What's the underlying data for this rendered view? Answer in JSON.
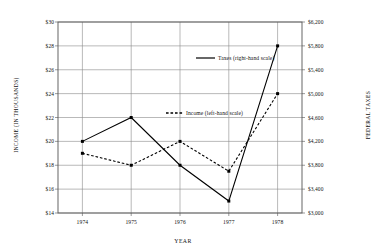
{
  "chart_data": {
    "type": "line",
    "title": "",
    "subtitle": "",
    "xlabel": "YEAR",
    "ylabel": "INCOME (IN THOUSANDS)",
    "ylabel_right": "FEDERAL TAXES",
    "grid": true,
    "legend_position": "inside-upper-center",
    "x": [
      1974,
      1975,
      1976,
      1977,
      1978
    ],
    "categories": [
      "1974",
      "1975",
      "1976",
      "1977",
      "1978"
    ],
    "xtick_labels": [
      "1974",
      "1975",
      "1976",
      "1977",
      "1978"
    ],
    "ylim": [
      14,
      30
    ],
    "ytick_values": [
      14,
      16,
      18,
      20,
      22,
      24,
      26,
      28,
      30
    ],
    "ytick_labels": [
      "$14",
      "$16",
      "$18",
      "$20",
      "$22",
      "$24",
      "$26",
      "$28",
      "$30"
    ],
    "ylim_right": [
      3000,
      6200
    ],
    "ytick_values_right": [
      3000,
      3400,
      3800,
      4200,
      4600,
      5000,
      5400,
      5800,
      6200
    ],
    "ytick_labels_right": [
      "$3,000",
      "$3,400",
      "$3,800",
      "$4,200",
      "$4,600",
      "$5,000",
      "$5,400",
      "$5,800",
      "$6,200"
    ],
    "series": [
      {
        "name": "Taxes (right-hand scale)",
        "axis": "right",
        "style": "solid",
        "color": "#000000",
        "values": [
          4200,
          4600,
          3800,
          3200,
          5800
        ],
        "values_on_left_scale": [
          20,
          22,
          18,
          15,
          28
        ]
      },
      {
        "name": "Income (left-hand scale)",
        "axis": "left",
        "style": "dashed",
        "color": "#000000",
        "values": [
          19,
          18,
          20,
          17.5,
          24
        ]
      }
    ]
  },
  "legend": {
    "taxes_label": "Taxes (right-hand scale)",
    "income_label": "Income (left-hand scale)"
  },
  "axes": {
    "x_title": "YEAR",
    "y_left_title": "INCOME (IN THOUSANDS)",
    "y_right_title": "FEDERAL TAXES"
  },
  "colors": {
    "line": "#000000",
    "grid": "#8a8a8a",
    "frame": "#555555",
    "background": "#ffffff",
    "text": "#111111"
  }
}
